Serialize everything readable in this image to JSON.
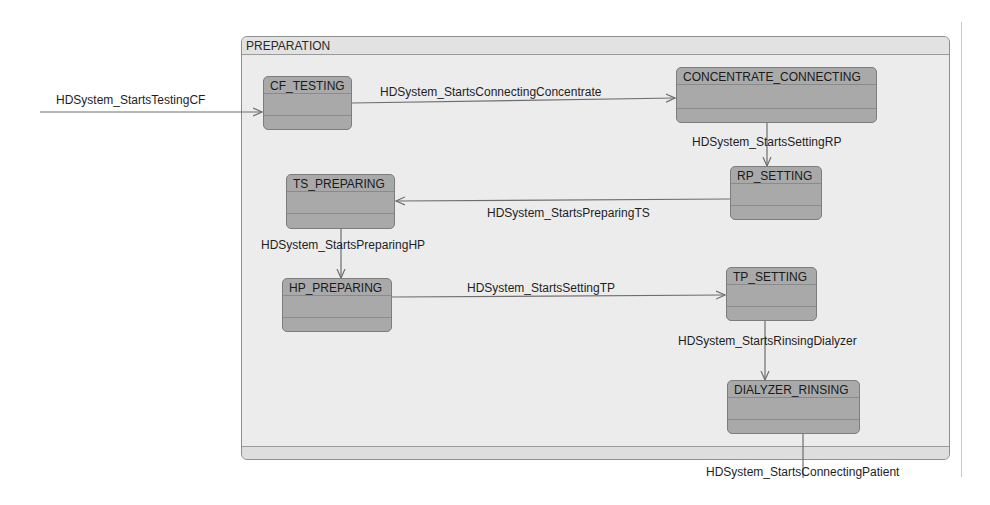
{
  "diagram": {
    "type": "state-machine",
    "composite_state": {
      "name": "PREPARATION"
    },
    "states": [
      {
        "id": "cf_testing",
        "name": "CF_TESTING"
      },
      {
        "id": "concentrate_connecting",
        "name": "CONCENTRATE_CONNECTING"
      },
      {
        "id": "rp_setting",
        "name": "RP_SETTING"
      },
      {
        "id": "ts_preparing",
        "name": "TS_PREPARING"
      },
      {
        "id": "hp_preparing",
        "name": "HP_PREPARING"
      },
      {
        "id": "tp_setting",
        "name": "TP_SETTING"
      },
      {
        "id": "dialyzer_rinsing",
        "name": "DIALYZER_RINSING"
      }
    ],
    "transitions": [
      {
        "from": "external",
        "to": "CF_TESTING",
        "event": "HDSystem_StartsTestingCF"
      },
      {
        "from": "CF_TESTING",
        "to": "CONCENTRATE_CONNECTING",
        "event": "HDSystem_StartsConnectingConcentrate"
      },
      {
        "from": "CONCENTRATE_CONNECTING",
        "to": "RP_SETTING",
        "event": "HDSystem_StartsSettingRP"
      },
      {
        "from": "RP_SETTING",
        "to": "TS_PREPARING",
        "event": "HDSystem_StartsPreparingTS"
      },
      {
        "from": "TS_PREPARING",
        "to": "HP_PREPARING",
        "event": "HDSystem_StartsPreparingHP"
      },
      {
        "from": "HP_PREPARING",
        "to": "TP_SETTING",
        "event": "HDSystem_StartsSettingTP"
      },
      {
        "from": "TP_SETTING",
        "to": "DIALYZER_RINSING",
        "event": "HDSystem_StartsRinsingDialyzer"
      },
      {
        "from": "DIALYZER_RINSING",
        "to": "external",
        "event": "HDSystem_StartsConnectingPatient"
      }
    ]
  },
  "colors": {
    "state_fill": "#a9a9a9",
    "composite_fill": "#ececec",
    "edge": "#6e6e6e"
  }
}
